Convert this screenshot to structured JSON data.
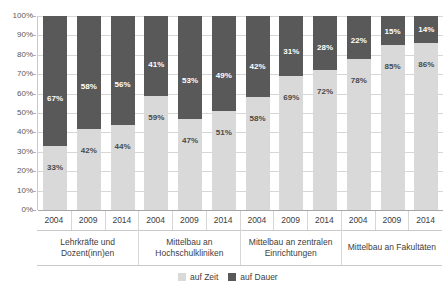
{
  "chart_data": {
    "type": "bar",
    "subtype": "stacked-100-percent",
    "title": "",
    "xlabel": "",
    "ylabel": "",
    "ylim": [
      0,
      100
    ],
    "ytick_labels": [
      "100%",
      "90%",
      "80%",
      "70%",
      "60%",
      "50%",
      "40%",
      "30%",
      "20%",
      "10%",
      "0%"
    ],
    "ytick_values": [
      100,
      90,
      80,
      70,
      60,
      50,
      40,
      30,
      20,
      10,
      0
    ],
    "grid": true,
    "legend_position": "bottom-right",
    "categories": [
      "2004",
      "2009",
      "2014",
      "2004",
      "2009",
      "2014",
      "2004",
      "2009",
      "2014",
      "2004",
      "2009",
      "2014"
    ],
    "groups": [
      {
        "label_line1": "Lehrkräfte und",
        "label_line2": "Dozent(inn)en",
        "span": 3
      },
      {
        "label_line1": "Mittelbau an",
        "label_line2": "Hochschulkliniken",
        "span": 3
      },
      {
        "label_line1": "Mittelbau an zentralen",
        "label_line2": "Einrichtungen",
        "span": 3
      },
      {
        "label_line1": "Mittelbau an Fakultäten",
        "label_line2": "",
        "span": 3
      }
    ],
    "series": [
      {
        "name": "auf Zeit",
        "color": "#d9d9d9",
        "values": [
          33,
          42,
          44,
          59,
          47,
          51,
          58,
          69,
          72,
          78,
          85,
          86
        ],
        "labels": [
          "33%",
          "42%",
          "44%",
          "59%",
          "47%",
          "51%",
          "58%",
          "69%",
          "72%",
          "78%",
          "85%",
          "86%"
        ]
      },
      {
        "name": "auf Dauer",
        "color": "#595959",
        "values": [
          67,
          58,
          56,
          41,
          53,
          49,
          42,
          31,
          28,
          22,
          15,
          14
        ],
        "labels": [
          "67%",
          "58%",
          "56%",
          "41%",
          "53%",
          "49%",
          "42%",
          "31%",
          "28%",
          "22%",
          "15%",
          "14%"
        ]
      }
    ]
  },
  "legend": {
    "items": [
      {
        "label": "auf Zeit",
        "color": "#d9d9d9"
      },
      {
        "label": "auf Dauer",
        "color": "#595959"
      }
    ]
  }
}
